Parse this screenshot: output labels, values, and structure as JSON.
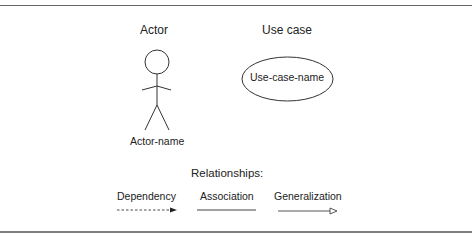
{
  "diagram": {
    "actor": {
      "heading": "Actor",
      "name_label": "Actor-name"
    },
    "use_case": {
      "heading": "Use case",
      "name_label": "Use-case-name"
    },
    "relationships": {
      "heading": "Relationships:",
      "items": [
        {
          "label": "Dependency",
          "style": "dashed-line-filled-arrow"
        },
        {
          "label": "Association",
          "style": "solid-line"
        },
        {
          "label": "Generalization",
          "style": "solid-line-hollow-triangle"
        }
      ]
    },
    "colors": {
      "stroke": "#333333",
      "text": "#222222",
      "rule": "#555555",
      "background": "#ffffff"
    }
  }
}
